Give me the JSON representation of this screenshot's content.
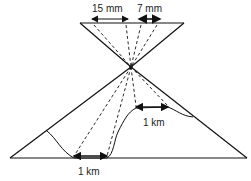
{
  "diagram": {
    "labels": {
      "film_left": "15 mm",
      "film_right": "7 mm",
      "ground_high": "1 km",
      "ground_low": "1 km"
    },
    "colors": {
      "line": "#111111",
      "text": "#222222",
      "background": "#ffffff"
    }
  }
}
